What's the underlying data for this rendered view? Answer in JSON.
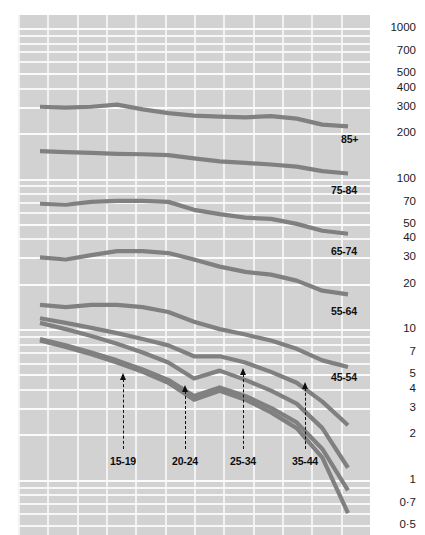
{
  "chart_data": {
    "type": "line",
    "title": "",
    "subtitle": "",
    "xlabel": "",
    "ylabel": "",
    "yscale": "log",
    "ylim": [
      0.5,
      1000
    ],
    "grid": true,
    "legend_position": "inline-right",
    "y_ticks": [
      {
        "label": "1000",
        "value": 1000
      },
      {
        "label": "700",
        "value": 700
      },
      {
        "label": "500",
        "value": 500
      },
      {
        "label": "400",
        "value": 400
      },
      {
        "label": "300",
        "value": 300
      },
      {
        "label": "200",
        "value": 200
      },
      {
        "label": "100",
        "value": 100
      },
      {
        "label": "70",
        "value": 70
      },
      {
        "label": "50",
        "value": 50
      },
      {
        "label": "40",
        "value": 40
      },
      {
        "label": "30",
        "value": 30
      },
      {
        "label": "20",
        "value": 20
      },
      {
        "label": "10",
        "value": 10
      },
      {
        "label": "7",
        "value": 7
      },
      {
        "label": "5",
        "value": 5
      },
      {
        "label": "4",
        "value": 4
      },
      {
        "label": "3",
        "value": 3
      },
      {
        "label": "2",
        "value": 2
      },
      {
        "label": "1",
        "value": 1
      },
      {
        "label": "0·7",
        "value": 0.7
      },
      {
        "label": "0·5",
        "value": 0.5
      }
    ],
    "x": [
      0,
      1,
      2,
      3,
      4,
      5,
      6,
      7,
      8,
      9,
      10,
      11,
      12
    ],
    "series": [
      {
        "name": "85+",
        "label": "85+",
        "values": [
          300,
          296,
          300,
          310,
          288,
          272,
          262,
          258,
          255,
          260,
          250,
          228,
          222
        ],
        "color": "#808080"
      },
      {
        "name": "75-84",
        "label": "75-84",
        "values": [
          152,
          150,
          148,
          146,
          145,
          143,
          136,
          130,
          127,
          124,
          120,
          112,
          108
        ],
        "color": "#808080"
      },
      {
        "name": "65-74",
        "label": "65-74",
        "values": [
          68,
          67,
          70,
          71,
          71,
          70,
          62,
          58,
          55,
          54,
          50,
          45,
          43
        ],
        "color": "#808080"
      },
      {
        "name": "55-64",
        "label": "55-64",
        "values": [
          30,
          29,
          31,
          33,
          33,
          32,
          29,
          26,
          24,
          23,
          21,
          18,
          17
        ],
        "color": "#808080"
      },
      {
        "name": "45-54",
        "label": "45-54",
        "values": [
          14.5,
          14.0,
          14.5,
          14.5,
          14.0,
          13.0,
          11.2,
          10.0,
          9.2,
          8.4,
          7.4,
          6.2,
          5.6
        ],
        "color": "#808080"
      },
      {
        "name": "35-44",
        "label": "35-44",
        "values": [
          11.8,
          11.0,
          10.2,
          9.4,
          8.6,
          7.8,
          6.6,
          6.6,
          6.0,
          5.2,
          4.4,
          3.3,
          2.3
        ],
        "color": "#808080"
      },
      {
        "name": "25-34",
        "label": "25-34",
        "values": [
          11.0,
          10.0,
          9.0,
          8.0,
          7.0,
          6.0,
          4.7,
          5.3,
          4.6,
          3.9,
          3.2,
          2.2,
          1.2
        ],
        "color": "#808080"
      },
      {
        "name": "20-24",
        "label": "20-24",
        "values": [
          8.6,
          7.8,
          7.0,
          6.2,
          5.4,
          4.6,
          3.6,
          4.1,
          3.6,
          3.0,
          2.4,
          1.6,
          0.85
        ],
        "color": "#808080"
      },
      {
        "name": "15-19",
        "label": "15-19",
        "values": [
          8.4,
          7.6,
          6.8,
          6.0,
          5.2,
          4.4,
          3.4,
          3.9,
          3.4,
          2.8,
          2.2,
          1.4,
          0.6
        ],
        "color": "#808080"
      }
    ],
    "series_labels": [
      {
        "text": "85+",
        "x": 341,
        "y": 133
      },
      {
        "text": "75-84",
        "x": 331,
        "y": 184
      },
      {
        "text": "65-74",
        "x": 331,
        "y": 245
      },
      {
        "text": "55-64",
        "x": 331,
        "y": 305
      },
      {
        "text": "45-54",
        "x": 331,
        "y": 371
      }
    ],
    "annotations": [
      {
        "text": "15-19",
        "x": 123,
        "head_y": 373,
        "label_y": 455
      },
      {
        "text": "20-24",
        "x": 185,
        "head_y": 385,
        "label_y": 455
      },
      {
        "text": "25-34",
        "x": 243,
        "head_y": 368,
        "label_y": 455
      },
      {
        "text": "35-44",
        "x": 305,
        "head_y": 382,
        "label_y": 455
      }
    ]
  },
  "colors": {
    "plot_background": "#d2d2d2",
    "gridline": "#f5f5f5",
    "line": "#808080",
    "text": "#111111",
    "page_background": "#ffffff"
  }
}
